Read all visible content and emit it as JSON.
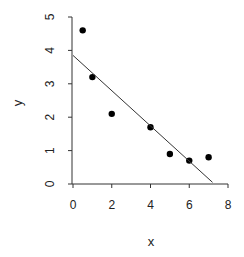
{
  "chart_data": {
    "type": "scatter",
    "title": "",
    "xlabel": "x",
    "ylabel": "y",
    "xlim": [
      0,
      8
    ],
    "ylim": [
      0,
      5
    ],
    "x_ticks": [
      0,
      2,
      4,
      6,
      8
    ],
    "y_ticks": [
      0,
      1,
      2,
      3,
      4,
      5
    ],
    "grid": false,
    "legend": null,
    "series": [
      {
        "name": "data",
        "type": "scatter",
        "x": [
          0.5,
          1,
          2,
          4,
          5,
          6,
          7
        ],
        "y": [
          4.6,
          3.2,
          2.1,
          1.7,
          0.9,
          0.7,
          0.8
        ]
      },
      {
        "name": "fit",
        "type": "line",
        "x": [
          0,
          7.2
        ],
        "y": [
          3.85,
          0.05
        ]
      }
    ]
  },
  "style": {
    "point_color": "#000000",
    "line_color": "#333333",
    "axis_color": "#333333"
  }
}
